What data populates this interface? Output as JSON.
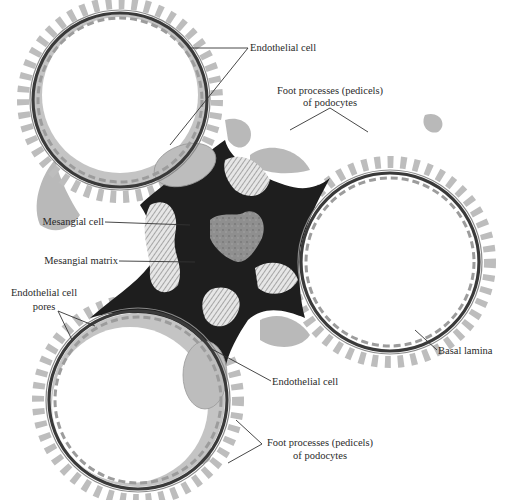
{
  "figure": {
    "colors": {
      "background": "#ffffff",
      "foot_processes": "#b9b9b9",
      "basal_lamina": "#3a3a3a",
      "mesangial_matrix": "#1e1e1e",
      "mesangial_cell": "#8c8c8c",
      "text": "#2a2a2a"
    }
  },
  "labels": {
    "endothelial_cell_top": "Endothelial cell",
    "foot_processes_top_line1": "Foot processes (pedicels)",
    "foot_processes_top_line2": "of podocytes",
    "mesangial_cell": "Mesangial cell",
    "mesangial_matrix": "Mesangial matrix",
    "endothelial_pores_line1": "Endothelial cell",
    "endothelial_pores_line2": "pores",
    "basal_lamina": "Basal lamina",
    "endothelial_cell_bottom": "Endothelial cell",
    "foot_processes_bottom_line1": "Foot processes (pedicels)",
    "foot_processes_bottom_line2": "of podocytes"
  },
  "capillaries": [
    {
      "name": "top-left",
      "cx": 120,
      "cy": 100,
      "r": 85
    },
    {
      "name": "right",
      "cx": 390,
      "cy": 262,
      "r": 88
    },
    {
      "name": "bottom-left",
      "cx": 138,
      "cy": 400,
      "r": 88
    }
  ]
}
